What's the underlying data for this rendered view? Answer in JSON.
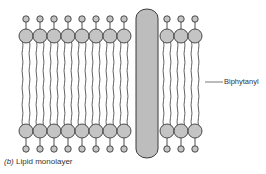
{
  "diagram": {
    "title": "Lipid monolayer",
    "caption_prefix": "(b)",
    "caption_text": "Lipid monolayer",
    "labels": {
      "biphytanyl": "Biphytanyl"
    },
    "colors": {
      "head_fill": "#c4c4c4",
      "stroke": "#3a3a3a",
      "bar_fill": "#bdbdbd",
      "background": "#ffffff"
    },
    "lipids": {
      "left_columns_x": [
        26,
        40,
        54,
        68,
        82,
        96,
        110,
        124
      ],
      "right_columns_x": [
        167,
        181,
        195
      ],
      "top_small_y": 19,
      "top_large_y": 36,
      "bottom_large_y": 131,
      "bottom_small_y": 149,
      "large_radius": 7,
      "small_radius": 3.2
    },
    "transmembrane_bar": {
      "x": 136,
      "y": 9,
      "width": 22,
      "height": 149
    }
  }
}
